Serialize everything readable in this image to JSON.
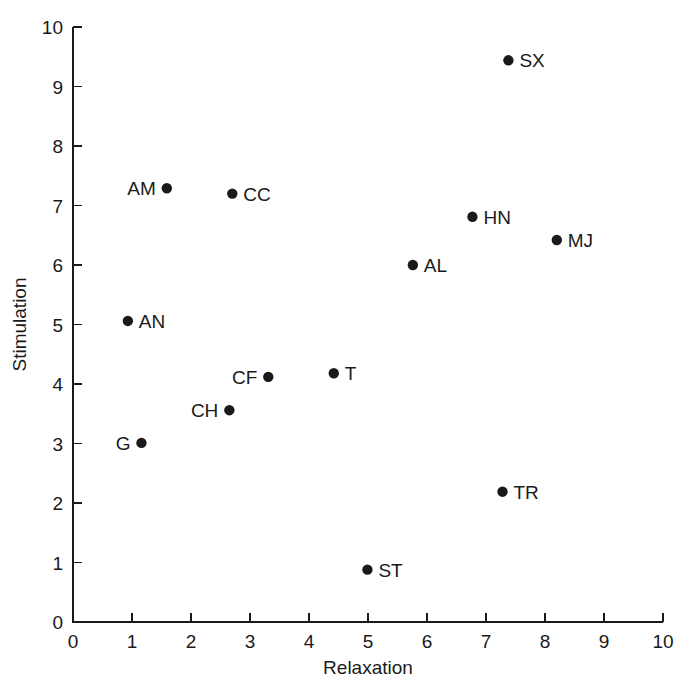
{
  "chart_data": {
    "type": "scatter",
    "title": "",
    "xlabel": "Relaxation",
    "ylabel": "Stimulation",
    "xlim": [
      0,
      10
    ],
    "ylim": [
      0,
      10
    ],
    "grid": false,
    "legend": "none",
    "xticks": [
      "0",
      "1",
      "2",
      "3",
      "4",
      "5",
      "6",
      "7",
      "8",
      "9",
      "10"
    ],
    "yticks": [
      "0",
      "1",
      "2",
      "3",
      "4",
      "5",
      "6",
      "7",
      "8",
      "9",
      "10"
    ],
    "marker_color": "#1a1a1a",
    "axis_color": "#1a1a1a",
    "points": [
      {
        "label": "SX",
        "x": 7.38,
        "y": 9.44,
        "label_side": "right"
      },
      {
        "label": "AM",
        "x": 1.59,
        "y": 7.29,
        "label_side": "left"
      },
      {
        "label": "CC",
        "x": 2.7,
        "y": 7.2,
        "label_side": "right"
      },
      {
        "label": "HN",
        "x": 6.77,
        "y": 6.81,
        "label_side": "right"
      },
      {
        "label": "MJ",
        "x": 8.2,
        "y": 6.42,
        "label_side": "right"
      },
      {
        "label": "AL",
        "x": 5.76,
        "y": 6.0,
        "label_side": "right"
      },
      {
        "label": "AN",
        "x": 0.93,
        "y": 5.06,
        "label_side": "right"
      },
      {
        "label": "T",
        "x": 4.42,
        "y": 4.18,
        "label_side": "right"
      },
      {
        "label": "CF",
        "x": 3.31,
        "y": 4.12,
        "label_side": "left"
      },
      {
        "label": "CH",
        "x": 2.65,
        "y": 3.56,
        "label_side": "left"
      },
      {
        "label": "G",
        "x": 1.16,
        "y": 3.01,
        "label_side": "left"
      },
      {
        "label": "TR",
        "x": 7.28,
        "y": 2.19,
        "label_side": "right"
      },
      {
        "label": "ST",
        "x": 4.99,
        "y": 0.88,
        "label_side": "right"
      }
    ]
  }
}
